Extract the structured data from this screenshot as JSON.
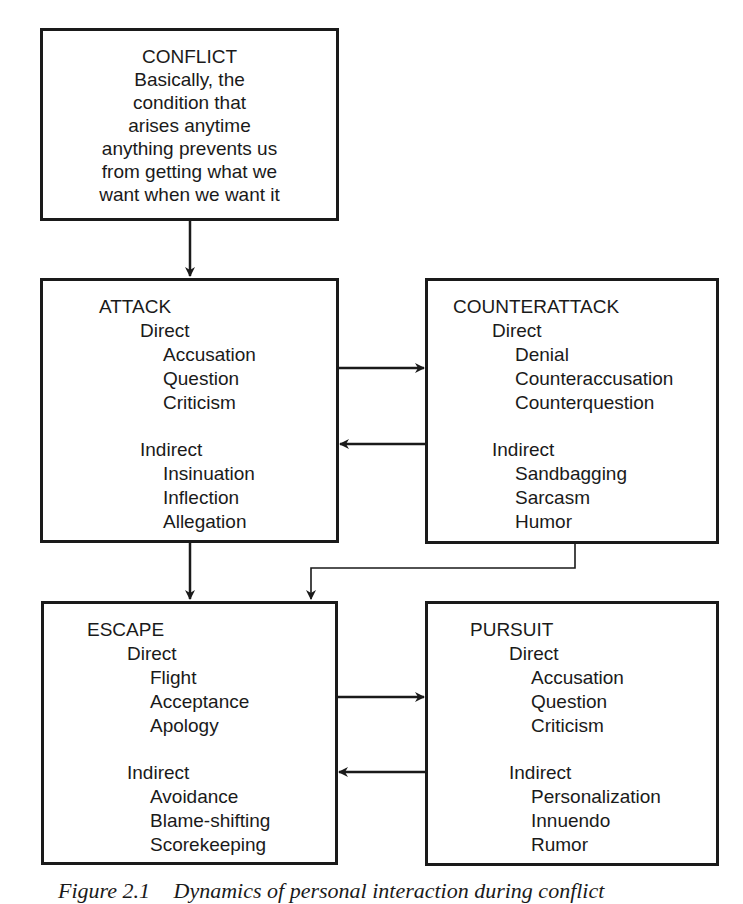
{
  "conflict": {
    "title": "CONFLICT",
    "description_lines": [
      "Basically, the",
      "condition that",
      "arises anytime",
      "anything prevents us",
      "from getting what we",
      "want when we want it"
    ]
  },
  "attack": {
    "title": "ATTACK",
    "direct_label": "Direct",
    "direct": [
      "Accusation",
      "Question",
      "Criticism"
    ],
    "indirect_label": "Indirect",
    "indirect": [
      "Insinuation",
      "Inflection",
      "Allegation"
    ]
  },
  "counterattack": {
    "title": "COUNTERATTACK",
    "direct_label": "Direct",
    "direct": [
      "Denial",
      "Counteraccusation",
      "Counterquestion"
    ],
    "indirect_label": "Indirect",
    "indirect": [
      "Sandbagging",
      "Sarcasm",
      "Humor"
    ]
  },
  "escape": {
    "title": "ESCAPE",
    "direct_label": "Direct",
    "direct": [
      "Flight",
      "Acceptance",
      "Apology"
    ],
    "indirect_label": "Indirect",
    "indirect": [
      "Avoidance",
      "Blame-shifting",
      "Scorekeeping"
    ]
  },
  "pursuit": {
    "title": "PURSUIT",
    "direct_label": "Direct",
    "direct": [
      "Accusation",
      "Question",
      "Criticism"
    ],
    "indirect_label": "Indirect",
    "indirect": [
      "Personalization",
      "Innuendo",
      "Rumor"
    ]
  },
  "caption": {
    "number": "Figure 2.1",
    "text": "Dynamics of personal interaction during conflict"
  },
  "colors": {
    "line": "#1a1a1a",
    "background": "#ffffff"
  }
}
